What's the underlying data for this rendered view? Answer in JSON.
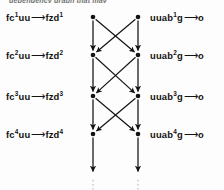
{
  "figure": {
    "caption_fragment": "dependency graph that may",
    "ink_color": "#121212",
    "page_color": "#fdfdfd"
  },
  "rows": [
    {
      "index": 1,
      "left": {
        "lhs": "fc",
        "lhs_sup": "1",
        "lhs_tail": "uu",
        "arrow": "⟶",
        "rhs": "fzd",
        "rhs_sup": "1"
      },
      "right": {
        "lhs": "uuab",
        "lhs_sup": "1",
        "lhs_tail": "g",
        "arrow": "⟶",
        "rhs": "o",
        "rhs_sup": ""
      }
    },
    {
      "index": 2,
      "left": {
        "lhs": "fc",
        "lhs_sup": "2",
        "lhs_tail": "uu",
        "arrow": "⟶",
        "rhs": "fzd",
        "rhs_sup": "2"
      },
      "right": {
        "lhs": "uuab",
        "lhs_sup": "2",
        "lhs_tail": "g",
        "arrow": "⟶",
        "rhs": "o",
        "rhs_sup": ""
      }
    },
    {
      "index": 3,
      "left": {
        "lhs": "fc",
        "lhs_sup": "3",
        "lhs_tail": "uu",
        "arrow": "⟶",
        "rhs": "fzd",
        "rhs_sup": "3"
      },
      "right": {
        "lhs": "uuab",
        "lhs_sup": "3",
        "lhs_tail": "g",
        "arrow": "⟶",
        "rhs": "o",
        "rhs_sup": ""
      }
    },
    {
      "index": 4,
      "left": {
        "lhs": "fc",
        "lhs_sup": "4",
        "lhs_tail": "uu",
        "arrow": "⟶",
        "rhs": "fzd",
        "rhs_sup": "4"
      },
      "right": {
        "lhs": "uuab",
        "lhs_sup": "4",
        "lhs_tail": "g",
        "arrow": "⟶",
        "rhs": "o",
        "rhs_sup": ""
      }
    }
  ],
  "chart_data": {
    "type": "diagram",
    "title": "dependency graph",
    "columns": [
      "left-column",
      "right-column"
    ],
    "column_x": [
      93,
      138
    ],
    "node_rows_y": [
      17,
      55,
      96,
      134
    ],
    "nodes": [
      {
        "id": "L1",
        "col": 0,
        "row": 0,
        "x": 93,
        "y": 17
      },
      {
        "id": "R1",
        "col": 1,
        "row": 0,
        "x": 138,
        "y": 17
      },
      {
        "id": "L2",
        "col": 0,
        "row": 1,
        "x": 93,
        "y": 55
      },
      {
        "id": "R2",
        "col": 1,
        "row": 1,
        "x": 138,
        "y": 55
      },
      {
        "id": "L3",
        "col": 0,
        "row": 2,
        "x": 93,
        "y": 96
      },
      {
        "id": "R3",
        "col": 1,
        "row": 2,
        "x": 138,
        "y": 96
      },
      {
        "id": "L4",
        "col": 0,
        "row": 3,
        "x": 93,
        "y": 134
      },
      {
        "id": "R4",
        "col": 1,
        "row": 3,
        "x": 138,
        "y": 134
      }
    ],
    "edges": [
      {
        "from": "L1",
        "to": "L2",
        "kind": "vertical"
      },
      {
        "from": "R1",
        "to": "R2",
        "kind": "vertical"
      },
      {
        "from": "L1",
        "to": "R2",
        "kind": "diagonal"
      },
      {
        "from": "R1",
        "to": "L2",
        "kind": "diagonal"
      },
      {
        "from": "L2",
        "to": "L3",
        "kind": "vertical"
      },
      {
        "from": "R2",
        "to": "R3",
        "kind": "vertical"
      },
      {
        "from": "L2",
        "to": "R3",
        "kind": "diagonal"
      },
      {
        "from": "R2",
        "to": "L3",
        "kind": "diagonal"
      },
      {
        "from": "L3",
        "to": "L4",
        "kind": "vertical"
      },
      {
        "from": "R3",
        "to": "R4",
        "kind": "vertical"
      },
      {
        "from": "L3",
        "to": "R4",
        "kind": "diagonal"
      },
      {
        "from": "R3",
        "to": "L4",
        "kind": "diagonal"
      },
      {
        "from": "L4",
        "to": "L-end",
        "kind": "vertical"
      },
      {
        "from": "R4",
        "to": "R-end",
        "kind": "vertical"
      }
    ],
    "continuation": {
      "style": "dotted",
      "y_from": 176,
      "y_to": 189,
      "columns_x": [
        93,
        138
      ]
    },
    "arrowheads": true,
    "grid": false,
    "legend": null
  }
}
